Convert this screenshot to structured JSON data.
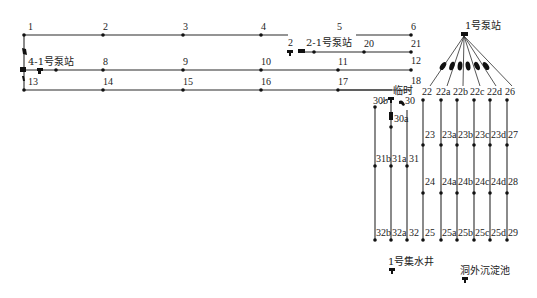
{
  "stations": {
    "pump1": "1号泵站",
    "pump21": "2-1号泵站",
    "pump41": "4-1号泵站",
    "temp": "临时",
    "sump1": "1号集水井",
    "settling": "洞外沉淀池"
  },
  "nodes": {
    "n1": "1",
    "n2": "2",
    "n3": "3",
    "n4": "4",
    "n5": "5",
    "n6": "6",
    "n8": "8",
    "n9": "9",
    "n10": "10",
    "n11": "11",
    "n12": "12",
    "n13": "13",
    "n14": "14",
    "n15": "15",
    "n16": "16",
    "n17": "17",
    "n18": "18",
    "n20": "20",
    "n21": "21",
    "n2b": "2",
    "n22": "22",
    "n22a": "22a",
    "n22b": "22b",
    "n22c": "22c",
    "n22d": "22d",
    "n26": "26",
    "n23": "23",
    "n23a": "23a",
    "n23b": "23b",
    "n23c": "23c",
    "n23d": "23d",
    "n27": "27",
    "n24": "24",
    "n24a": "24a",
    "n24b": "24b",
    "n24c": "24c",
    "n24d": "24d",
    "n28": "28",
    "n25": "25",
    "n25a": "25a",
    "n25b": "25b",
    "n25c": "25c",
    "n25d": "25d",
    "n29": "29",
    "n30": "30",
    "n30a": "30a",
    "n30b": "30b",
    "n31": "31",
    "n31a": "31a",
    "n31b": "31b",
    "n32": "32",
    "n32a": "32a",
    "n32b": "32b"
  }
}
